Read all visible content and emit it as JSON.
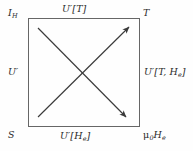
{
  "figure": {
    "kind": "legendre-transform-square",
    "background_color": "#fefefe",
    "line_color": "#666666",
    "arrow_color": "#3a3a3a",
    "text_color": "#2a2a2a"
  },
  "corners": {
    "top_left": "I",
    "top_left_sub": "H",
    "top_right": "T",
    "bottom_left": "S",
    "bottom_right_mu": "μ",
    "bottom_right_mu_sub": "0",
    "bottom_right_field": "H",
    "bottom_right_field_sub": "e"
  },
  "edges": {
    "top": "U′[T]",
    "left": "U′",
    "right_main": "U′[T, H",
    "right_sub": "e",
    "right_close": "]",
    "bottom_main": "U′[H",
    "bottom_sub": "e",
    "bottom_close": "]"
  },
  "arrows": [
    {
      "name": "descending-arrow",
      "from_x": 38,
      "from_y": 28,
      "to_x": 126,
      "to_y": 117,
      "direction": "down-right"
    },
    {
      "name": "ascending-arrow",
      "from_x": 38,
      "from_y": 117,
      "to_x": 129,
      "to_y": 27,
      "direction": "up-right"
    }
  ],
  "box": {
    "left": 28,
    "top": 18,
    "width": 112,
    "height": 109
  }
}
